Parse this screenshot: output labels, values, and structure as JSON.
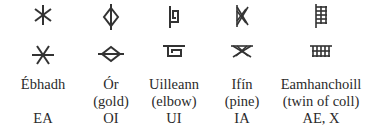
{
  "table": {
    "columns": [
      {
        "name": "Ébhadh",
        "gloss": "",
        "transliteration": "EA",
        "glyph_icon": "ebhadh-icon"
      },
      {
        "name": "Ór",
        "gloss": "(gold)",
        "transliteration": "OI",
        "glyph_icon": "or-icon"
      },
      {
        "name": "Uilleann",
        "gloss": "(elbow)",
        "transliteration": "UI",
        "glyph_icon": "uilleann-icon"
      },
      {
        "name": "Ifín",
        "gloss": "(pine)",
        "transliteration": "IA",
        "glyph_icon": "ifin-icon"
      },
      {
        "name": "Eamhanchoill",
        "gloss": "(twin of coll)",
        "transliteration": "AE, X",
        "glyph_icon": "eamhanchoill-icon"
      }
    ]
  },
  "colors": {
    "text": "#2a2a2a",
    "glyph": "#333333",
    "background": "#ffffff"
  }
}
